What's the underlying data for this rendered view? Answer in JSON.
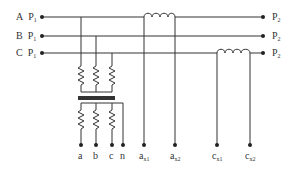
{
  "diagram": {
    "type": "three-phase metering circuit with voltage transformer and current coils",
    "line_color": "#333333",
    "phases": [
      {
        "name": "A",
        "left_label": "P",
        "left_sub": "1",
        "right_label": "P",
        "right_sub": "2"
      },
      {
        "name": "B",
        "left_label": "P",
        "left_sub": "1",
        "right_label": "P",
        "right_sub": "2"
      },
      {
        "name": "C",
        "left_label": "P",
        "left_sub": "1",
        "right_label": "P",
        "right_sub": "2"
      }
    ],
    "vt_terminals": [
      {
        "label": "a"
      },
      {
        "label": "b"
      },
      {
        "label": "c"
      },
      {
        "label": "n"
      }
    ],
    "ct_terminals": [
      {
        "label": "a",
        "sub": "x1"
      },
      {
        "label": "a",
        "sub": "x2"
      },
      {
        "label": "c",
        "sub": "x1"
      },
      {
        "label": "c",
        "sub": "x2"
      }
    ]
  }
}
